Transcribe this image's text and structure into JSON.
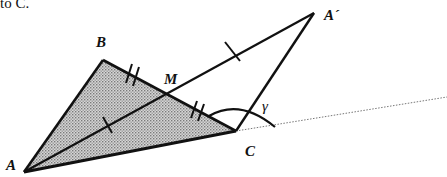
{
  "caption_fragment": "to C.",
  "labels": {
    "A": "A",
    "B": "B",
    "C": "C",
    "M": "M",
    "A_prime": "A´",
    "gamma": "γ"
  },
  "colors": {
    "stroke": "#111111",
    "fill": "#b9b9b9",
    "dotted": "#777777"
  },
  "points": {
    "A": [
      24,
      172
    ],
    "B": [
      103,
      60
    ],
    "C": [
      236,
      131
    ],
    "M": [
      168,
      95
    ],
    "A_prime": [
      314,
      13
    ],
    "ray_end": [
      447,
      97
    ]
  }
}
